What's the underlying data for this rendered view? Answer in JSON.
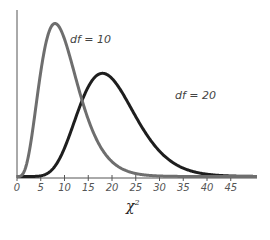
{
  "chart_data": {
    "type": "line",
    "title": "",
    "xlabel": "χ²",
    "ylabel": "",
    "xlim": [
      0,
      50
    ],
    "x_ticks": [
      0,
      5,
      10,
      15,
      20,
      25,
      30,
      35,
      40,
      45
    ],
    "grid": false,
    "series": [
      {
        "name": "df = 10",
        "df": 10,
        "color": "#6e6e6e",
        "label_pos": [
          70,
          33
        ]
      },
      {
        "name": "df = 20",
        "df": 20,
        "color": "#1e1e1e",
        "label_pos": [
          175,
          89
        ]
      }
    ],
    "annotations": [
      "df = 10",
      "df = 20"
    ]
  },
  "labels": {
    "df10": "df = 10",
    "df20": "df = 20",
    "xaxis_base": "χ",
    "xaxis_sup": "2"
  },
  "layout": {
    "x0_px": 17,
    "px_per_unit": 4.75,
    "baseline_px": 178,
    "axis_end_px": 257,
    "yaxis_top_px": 10,
    "peak_px_df10": 25
  }
}
